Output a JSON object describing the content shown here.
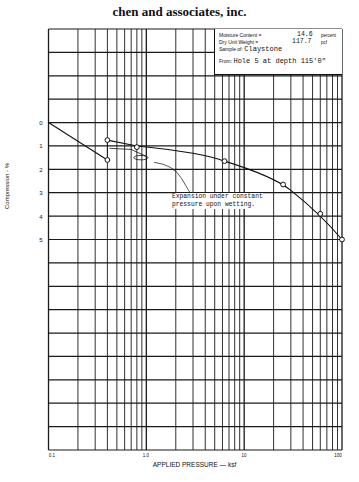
{
  "header": {
    "company": "chen and associates, inc."
  },
  "info_box": {
    "moisture_label": "Moisture Content =",
    "moisture_value": "14.6",
    "moisture_unit": "percent",
    "dry_weight_label": "Dry Unit Weight =",
    "dry_weight_value": "117.7",
    "dry_weight_unit": "pcf",
    "sample_label": "Sample of:",
    "sample_value": "Claystone",
    "from_label": "From:",
    "from_value": "Hole 5 at depth 115'0\""
  },
  "chart_data": {
    "type": "line",
    "title": "chen and associates, inc.",
    "xlabel": "APPLIED PRESSURE — ksf",
    "ylabel": "Compression - %",
    "xscale": "log",
    "xlim": [
      0.1,
      100
    ],
    "ylim": [
      -4,
      14
    ],
    "y_inverted": true,
    "grid": true,
    "x_ticks": [
      "0.1",
      "1.0",
      "10",
      "100"
    ],
    "y_ticks": [
      "0",
      "1",
      "2",
      "3",
      "4",
      "5"
    ],
    "series": [
      {
        "name": "Initial loading",
        "x": [
          0.1,
          0.4
        ],
        "y": [
          0.0,
          1.6
        ]
      },
      {
        "name": "Expansion under constant pressure upon wetting",
        "x": [
          0.4,
          0.4
        ],
        "y": [
          1.6,
          0.75
        ]
      },
      {
        "name": "Consolidation curve after wetting",
        "x": [
          0.4,
          0.8,
          6.3,
          25,
          60,
          100
        ],
        "y": [
          0.75,
          1.05,
          1.65,
          2.65,
          3.9,
          5.0
        ]
      }
    ],
    "annotations": [
      {
        "text": "Expansion under constant pressure upon wetting.",
        "x": 2.2,
        "y": 3.2
      }
    ]
  },
  "axes": {
    "ylabel": "Compression - %",
    "xlabel": "APPLIED PRESSURE — ksf",
    "yticks": [
      "0",
      "1",
      "2",
      "3",
      "4",
      "5"
    ],
    "xticks": [
      "0.1",
      "1.0",
      "10",
      "100"
    ]
  },
  "annotation": {
    "line1": "Expansion under constant",
    "line2": "pressure upon wetting."
  }
}
